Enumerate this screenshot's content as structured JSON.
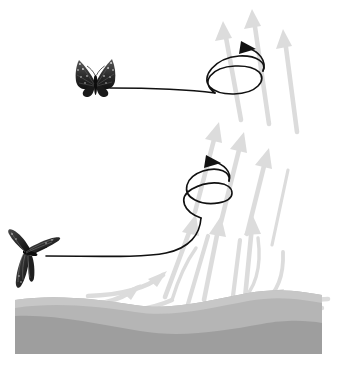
{
  "figure": {
    "type": "diagram",
    "background_color": "#ffffff",
    "width": 337,
    "height": 372
  },
  "colors": {
    "background": "#ffffff",
    "thermal_arrow_fill": "#dcdcdc",
    "thermal_arrow_stroke": "#cfcfcf",
    "thermal_line_stroke": "#dcdcdc",
    "ground_upper": "#b3b3b3",
    "ground_lower": "#9e9e9e",
    "ground_highlight": "#c9c9c9",
    "flight_path": "#111111",
    "butterfly_dark": "#1a1a1a",
    "butterfly_mid": "#4d4d4d",
    "butterfly_light": "#d8d8d8"
  },
  "ground": {
    "label": "ground-terrain",
    "upper_band_label": "ground-upper-band",
    "lower_band_label": "ground-lower-band",
    "upper_path": "M0,300 C40,294 80,299 120,304 C160,309 200,300 240,294 C275,289 310,294 337,297 L337,372 L0,372 Z",
    "lower_path": "M0,318 C40,316 85,325 130,332 C175,339 215,333 260,327 C292,323 318,325 337,327 L337,372 L0,372 Z",
    "highlight_path": "M0,300 C40,294 80,299 120,304 C160,309 200,300 240,294 C275,289 310,294 337,297 L337,305 C310,302 275,297 240,302 C200,308 160,317 120,312 C80,307 40,302 0,308 Z"
  },
  "thermal": {
    "label": "thermal-updraft",
    "description": "rising warm air column",
    "arrow_count": 14,
    "arrows": [
      {
        "name": "thermal-arrow-top-left",
        "path": "M238,108 L223,20",
        "head": "M223,20 L215,38 L232,35 Z",
        "width": 4.2
      },
      {
        "name": "thermal-arrow-top-mid",
        "path": "M266,112 L252,8",
        "head": "M252,8 L244,27 L261,24 Z",
        "width": 4.2
      },
      {
        "name": "thermal-arrow-top-right",
        "path": "M295,122 L283,28",
        "head": "M283,28 L276,46 L292,43 Z",
        "width": 4.2
      },
      {
        "name": "thermal-arrow-top-far",
        "path": "M252,372 L252,372",
        "head": "",
        "width": 0
      },
      {
        "name": "thermal-arrow-mid-left",
        "path": "M197,208 L219,122",
        "head": "M219,122 L206,137 L222,140 Z",
        "width": 4.2
      },
      {
        "name": "thermal-arrow-mid-center",
        "path": "M222,218 L243,132",
        "head": "M243,132 L230,147 L246,150 Z",
        "width": 4.2
      },
      {
        "name": "thermal-arrow-mid-right",
        "path": "M248,230 L268,148",
        "head": "M268,148 L255,163 L271,166 Z",
        "width": 4.2
      },
      {
        "name": "thermal-arrow-low-left",
        "path": "M167,296 L197,216",
        "head": "M197,216 L185,232 L201,236 Z",
        "width": 4.2
      },
      {
        "name": "thermal-arrow-low-center",
        "path": "M176,300 L204,228",
        "head": "",
        "width": 4.2
      },
      {
        "name": "thermal-arrow-low-mid",
        "path": "M197,302 L219,212",
        "head": "M219,212 L207,228 L223,231 Z",
        "width": 4.2
      },
      {
        "name": "thermal-arrow-low-right",
        "path": "M224,306 L235,226",
        "head": "",
        "width": 4.2
      },
      {
        "name": "thermal-arrow-column-r",
        "path": "M244,300 L252,216",
        "head": "M252,216 L244,234 L260,232 Z",
        "width": 4.2
      },
      {
        "name": "thermal-arrow-ground-left",
        "path": "M60,306 C95,306 118,300 134,288",
        "head": "M134,288 L118,295 L128,302 Z",
        "width": 4.2
      },
      {
        "name": "thermal-arrow-ground-left2",
        "path": "M88,296 C120,295 143,288 158,276",
        "head": "M158,276 L141,283 L152,290 Z",
        "width": 4.2
      },
      {
        "name": "thermal-arrow-ground-right",
        "path": "M325,300 C295,302 278,300 266,294",
        "head": "M266,294 L284,292 L280,302 Z",
        "width": 4.2
      },
      {
        "name": "thermal-arrow-ground-r2",
        "path": "M318,307 C290,308 272,306 258,300",
        "head": "",
        "width": 4.2
      },
      {
        "name": "thermal-stream-right",
        "path": "M282,256 C282,278 276,292 263,302",
        "head": "",
        "width": 3.4
      },
      {
        "name": "thermal-stream-left-curve",
        "path": "M115,304 C140,300 160,292 172,280",
        "head": "",
        "width": 3.4
      }
    ]
  },
  "flight_paths": [
    {
      "name": "upper-flight-path",
      "description": "upper butterfly glides right then spirals upward in the thermal",
      "glide_path": "M112,88 C150,88 190,90 214,92",
      "spiral_path": "M214,92 C198,80 214,66 236,66 C258,66 266,78 256,87 C246,96 220,96 210,86 C200,76 214,58 238,56 C256,55 266,62 262,70",
      "arrow_head": "M244,41 L258,49 L242,52 Z",
      "arrow_tip": "M262,68 C266,58 258,48 246,45"
    },
    {
      "name": "lower-flight-path",
      "description": "lower butterfly glides right then rises and spirals in the thermal",
      "glide_path": "M46,255 C90,255 140,257 162,254 C186,250 198,236 200,218",
      "spiral_path": "M200,218 C182,210 178,196 194,188 C212,179 232,182 232,192 C232,202 210,206 196,200 C182,194 184,178 202,172 C218,167 230,172 228,180",
      "arrow_head": "M208,160 L222,168 L206,171 Z",
      "arrow_tip": "M228,178 C232,170 224,162 212,160"
    }
  ],
  "butterflies": [
    {
      "name": "upper-butterfly",
      "species_style": "monarch",
      "pose": "wings-raised-front-view",
      "x": 76,
      "y": 58,
      "width": 38,
      "height": 38
    },
    {
      "name": "lower-butterfly",
      "species_style": "monarch",
      "pose": "wings-side-profile",
      "x": 8,
      "y": 228,
      "width": 52,
      "height": 62
    }
  ]
}
